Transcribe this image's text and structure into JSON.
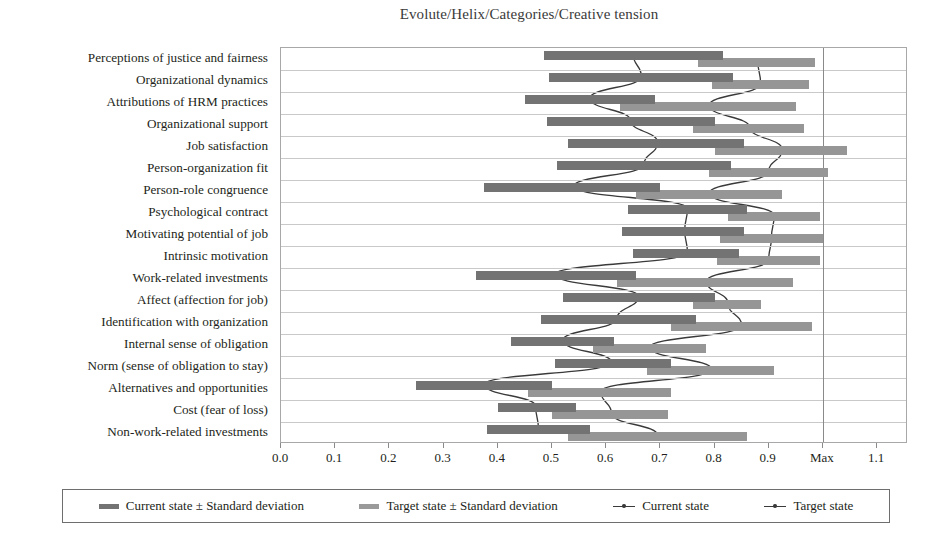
{
  "chart_data": {
    "type": "bar",
    "title": "Evolute/Helix/Categories/Creative tension",
    "xlabel": "",
    "ylabel": "",
    "xlim": [
      0.0,
      1.157
    ],
    "grid": true,
    "orientation": "horizontal",
    "legend_position": "bottom",
    "x_ticks": [
      "0.0",
      "0.1",
      "0.2",
      "0.3",
      "0.4",
      "0.5",
      "0.6",
      "0.7",
      "0.8",
      "0.9",
      "Max",
      "1.1"
    ],
    "x_tick_values": [
      0.0,
      0.1,
      0.2,
      0.3,
      0.4,
      0.5,
      0.6,
      0.7,
      0.8,
      0.9,
      1.0,
      1.1
    ],
    "max_line_value": 1.0,
    "categories": [
      "Perceptions of justice and fairness",
      "Organizational dynamics",
      "Attributions of HRM practices",
      "Organizational support",
      "Job satisfaction",
      "Person-organization fit",
      "Person-role congruence",
      "Psychological contract",
      "Motivating potential of job",
      "Intrinsic motivation",
      "Work-related investments",
      "Affect (affection for job)",
      "Identification with organization",
      "Internal sense of obligation",
      "Norm (sense of obligation to stay)",
      "Alternatives and opportunities",
      "Cost (fear of loss)",
      "Non-work-related investments"
    ],
    "series": [
      {
        "name": "Current state ± Standard deviation",
        "type": "range-bar",
        "color": "#737373",
        "low": [
          0.485,
          0.495,
          0.45,
          0.49,
          0.53,
          0.51,
          0.375,
          0.64,
          0.63,
          0.65,
          0.36,
          0.52,
          0.48,
          0.425,
          0.505,
          0.25,
          0.4,
          0.38
        ],
        "high": [
          0.815,
          0.835,
          0.69,
          0.8,
          0.855,
          0.83,
          0.7,
          0.86,
          0.855,
          0.845,
          0.655,
          0.8,
          0.765,
          0.615,
          0.72,
          0.5,
          0.545,
          0.57
        ]
      },
      {
        "name": "Target state ± Standard deviation",
        "type": "range-bar",
        "color": "#969696",
        "low": [
          0.77,
          0.795,
          0.625,
          0.76,
          0.8,
          0.79,
          0.655,
          0.825,
          0.81,
          0.805,
          0.62,
          0.76,
          0.72,
          0.575,
          0.675,
          0.455,
          0.5,
          0.53
        ],
        "high": [
          0.985,
          0.975,
          0.95,
          0.965,
          1.045,
          1.01,
          0.925,
          0.995,
          1.0,
          0.995,
          0.945,
          0.885,
          0.98,
          0.785,
          0.91,
          0.72,
          0.715,
          0.86
        ]
      },
      {
        "name": "Current state",
        "type": "line",
        "color": "#3a3a3a",
        "values": [
          0.65,
          0.665,
          0.57,
          0.645,
          0.695,
          0.67,
          0.54,
          0.75,
          0.745,
          0.75,
          0.505,
          0.66,
          0.62,
          0.52,
          0.61,
          0.375,
          0.47,
          0.475
        ]
      },
      {
        "name": "Target state",
        "type": "line",
        "color": "#3a3a3a",
        "values": [
          0.88,
          0.885,
          0.79,
          0.865,
          0.925,
          0.9,
          0.79,
          0.91,
          0.905,
          0.9,
          0.785,
          0.825,
          0.85,
          0.68,
          0.795,
          0.59,
          0.61,
          0.695
        ]
      }
    ]
  },
  "legend": {
    "items": [
      {
        "label": "Current state ± Standard deviation",
        "marker": "bar-dark"
      },
      {
        "label": "Target state ± Standard deviation",
        "marker": "bar-light"
      },
      {
        "label": "Current state",
        "marker": "line-marker"
      },
      {
        "label": "Target state",
        "marker": "line-marker"
      }
    ]
  }
}
